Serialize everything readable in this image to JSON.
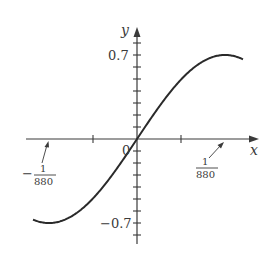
{
  "chart_data": {
    "type": "line",
    "title": "",
    "xlabel": "x",
    "ylabel": "y",
    "function": "0.7 sin(2π·440·x)",
    "ylim": [
      -0.7,
      0.7
    ],
    "xlim": [
      -0.00142,
      0.00142
    ],
    "y_tick_labels": [
      "0.7",
      "-0.7"
    ],
    "y_tick_step": 0.1,
    "x_tick_labels": [
      "-1/880",
      "1/880"
    ],
    "origin_label": "0",
    "annotations": [
      {
        "label": "-1/880",
        "x": -0.0011364,
        "y": 0
      },
      {
        "label": "1/880",
        "x": 0.0011364,
        "y": 0
      }
    ],
    "key_points": {
      "max": {
        "x": 0.000568,
        "y": 0.7
      },
      "min": {
        "x": -0.000568,
        "y": -0.7
      },
      "zeros": [
        -0.0011364,
        0,
        0.0011364
      ]
    },
    "grid": false,
    "legend": null
  },
  "labels": {
    "y_axis": "y",
    "x_axis": "x",
    "origin": "0",
    "y_max": "0.7",
    "y_min": "−0.7",
    "left_num": "1",
    "left_den": "880",
    "left_sign": "−",
    "right_num": "1",
    "right_den": "880"
  }
}
